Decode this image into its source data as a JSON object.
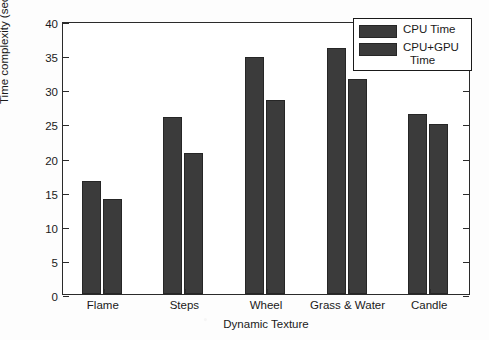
{
  "chart_data": {
    "type": "bar",
    "title": "",
    "xlabel": "Dynamic Texture",
    "ylabel": "Time complexity (sec)",
    "categories": [
      "Flame",
      "Steps",
      "Wheel",
      "Grass & Water",
      "Candle"
    ],
    "series": [
      {
        "name": "CPU Time",
        "values": [
          16.5,
          26.0,
          34.8,
          36.1,
          26.4
        ],
        "color": "#3b3b3b"
      },
      {
        "name": "CPU+GPU Time",
        "values": [
          13.9,
          20.6,
          28.5,
          31.5,
          24.9
        ],
        "color": "#3b3b3b"
      }
    ],
    "ylim": [
      0,
      40
    ],
    "yticks": [
      0,
      5,
      10,
      15,
      20,
      25,
      30,
      35,
      40
    ],
    "ytick_labels": [
      "0",
      "5",
      "10",
      "15",
      "20",
      "25",
      "30",
      "35",
      "40"
    ],
    "grid": false,
    "legend_position": "top-right",
    "legend_entries": [
      {
        "label": "CPU Time",
        "line1": "CPU Time",
        "line2": ""
      },
      {
        "label": "CPU+GPU Time",
        "line1": "CPU+GPU",
        "line2": "Time"
      }
    ]
  },
  "figure": {
    "background_color": "#ffffff",
    "axis_color": "#2b2b2b",
    "text_color": "#1a1a1a"
  }
}
